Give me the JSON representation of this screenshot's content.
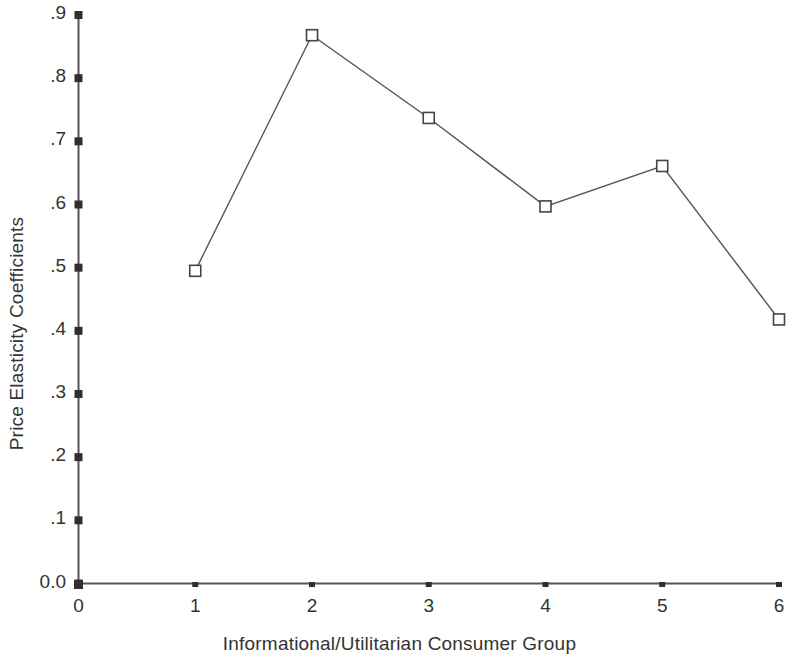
{
  "chart_data": {
    "type": "line",
    "title": "",
    "xlabel": "Informational/Utilitarian Consumer Group",
    "ylabel": "Price Elasticity Coefficients",
    "x": [
      1,
      2,
      3,
      4,
      5,
      6
    ],
    "values": [
      0.495,
      0.868,
      0.737,
      0.597,
      0.661,
      0.418
    ],
    "series": [
      {
        "name": "Price Elasticity Coefficients",
        "x": [
          1,
          2,
          3,
          4,
          5,
          6
        ],
        "values": [
          0.495,
          0.868,
          0.737,
          0.597,
          0.661,
          0.418
        ]
      }
    ],
    "xlim": [
      0,
      6
    ],
    "ylim": [
      0.0,
      0.9
    ],
    "xticks": [
      0,
      1,
      2,
      3,
      4,
      5,
      6
    ],
    "xtick_labels": [
      "0",
      "1",
      "2",
      "3",
      "4",
      "5",
      "6"
    ],
    "yticks": [
      0.0,
      0.1,
      0.2,
      0.3,
      0.4,
      0.5,
      0.6,
      0.7,
      0.8,
      0.9
    ],
    "ytick_labels": [
      "0.0",
      ".1",
      ".2",
      ".3",
      ".4",
      ".5",
      ".6",
      ".7",
      ".8",
      ".9"
    ],
    "grid": false,
    "legend": false,
    "legend_position": "none",
    "marker": "open-square",
    "line_color": "#555555",
    "marker_edge_color": "#444444",
    "marker_face_color": "#ffffff",
    "axis_color": "#555555",
    "background_color": "#ffffff",
    "text_color": "#333333"
  }
}
